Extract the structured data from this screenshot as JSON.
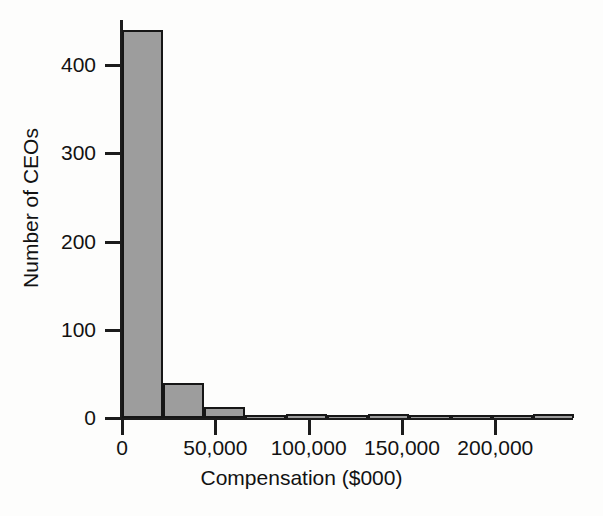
{
  "chart_data": {
    "type": "bar",
    "title": "",
    "subtitle": "",
    "xlabel": "Compensation ($000)",
    "ylabel": "Number of CEOs",
    "xlim": [
      0,
      240000
    ],
    "ylim": [
      0,
      440
    ],
    "grid": false,
    "legend": null,
    "bin_width": 22000,
    "x_ticks": [
      {
        "value": 0,
        "label": "0"
      },
      {
        "value": 50000,
        "label": "50,000"
      },
      {
        "value": 100000,
        "label": "100,000"
      },
      {
        "value": 150000,
        "label": "150,000"
      },
      {
        "value": 200000,
        "label": "200,000"
      }
    ],
    "y_ticks": [
      {
        "value": 0,
        "label": "0"
      },
      {
        "value": 100,
        "label": "100"
      },
      {
        "value": 200,
        "label": "200"
      },
      {
        "value": 300,
        "label": "300"
      },
      {
        "value": 400,
        "label": "400"
      }
    ],
    "bins": [
      {
        "x0": 0,
        "x1": 22000,
        "value": 440
      },
      {
        "x0": 22000,
        "x1": 44000,
        "value": 40
      },
      {
        "x0": 44000,
        "x1": 66000,
        "value": 13
      },
      {
        "x0": 66000,
        "x1": 88000,
        "value": 3
      },
      {
        "x0": 88000,
        "x1": 110000,
        "value": 5
      },
      {
        "x0": 110000,
        "x1": 132000,
        "value": 1
      },
      {
        "x0": 132000,
        "x1": 154000,
        "value": 4
      },
      {
        "x0": 154000,
        "x1": 176000,
        "value": 1
      },
      {
        "x0": 176000,
        "x1": 198000,
        "value": 1
      },
      {
        "x0": 198000,
        "x1": 220000,
        "value": 1
      },
      {
        "x0": 220000,
        "x1": 242000,
        "value": 4
      }
    ],
    "categories": [
      "0-22,000",
      "22,000-44,000",
      "44,000-66,000",
      "66,000-88,000",
      "88,000-110,000",
      "110,000-132,000",
      "132,000-154,000",
      "154,000-176,000",
      "176,000-198,000",
      "198,000-220,000",
      "220,000-242,000"
    ],
    "values": [
      440,
      40,
      13,
      3,
      5,
      1,
      4,
      1,
      1,
      1,
      4
    ],
    "colors": {
      "bar_fill": "#9d9d9d",
      "bar_edge": "#161616",
      "axis": "#1c1c1c",
      "text": "#121212",
      "background": "#fdfdfc"
    }
  }
}
